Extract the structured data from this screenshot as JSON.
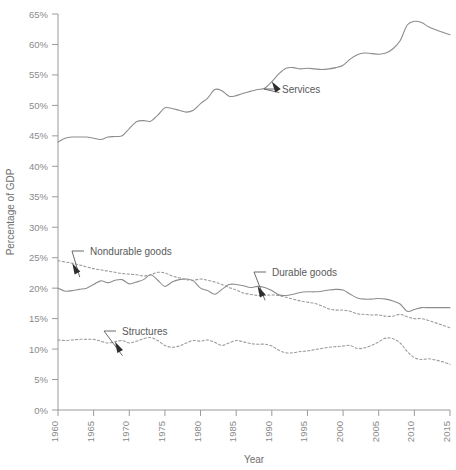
{
  "chart_data": {
    "type": "line",
    "title": "",
    "xlabel": "Year",
    "ylabel": "Percentage of GDP",
    "xlim": [
      1960,
      2015
    ],
    "ylim": [
      0,
      65
    ],
    "grid": false,
    "legend_position": "inline-annotations",
    "xticks": [
      "1960",
      "1965",
      "1970",
      "1975",
      "1980",
      "1985",
      "1990",
      "1995",
      "2000",
      "2005",
      "2010",
      "2015"
    ],
    "yticks": [
      "0%",
      "5%",
      "10%",
      "15%",
      "20%",
      "25%",
      "30%",
      "35%",
      "40%",
      "45%",
      "50%",
      "55%",
      "60%",
      "65%"
    ],
    "x": [
      1960,
      1961,
      1962,
      1963,
      1964,
      1965,
      1966,
      1967,
      1968,
      1969,
      1970,
      1971,
      1972,
      1973,
      1974,
      1975,
      1976,
      1977,
      1978,
      1979,
      1980,
      1981,
      1982,
      1983,
      1984,
      1985,
      1986,
      1987,
      1988,
      1989,
      1990,
      1991,
      1992,
      1993,
      1994,
      1995,
      1996,
      1997,
      1998,
      1999,
      2000,
      2001,
      2002,
      2003,
      2004,
      2005,
      2006,
      2007,
      2008,
      2009,
      2010,
      2011,
      2012,
      2013,
      2014,
      2015
    ],
    "series": [
      {
        "name": "Services",
        "style": "solid",
        "color": "#8d8d8d",
        "annotation": "Services",
        "annotation_year": 1990,
        "values": [
          44.0,
          44.6,
          44.8,
          44.8,
          44.8,
          44.6,
          44.4,
          44.8,
          44.9,
          45.0,
          46.2,
          47.3,
          47.5,
          47.4,
          48.4,
          49.6,
          49.5,
          49.2,
          48.9,
          49.2,
          50.3,
          51.2,
          52.6,
          52.4,
          51.5,
          51.6,
          52.0,
          52.3,
          52.6,
          52.8,
          53.9,
          55.2,
          56.1,
          56.2,
          56.0,
          56.1,
          56.0,
          55.9,
          56.0,
          56.2,
          56.6,
          57.6,
          58.3,
          58.6,
          58.5,
          58.4,
          58.6,
          59.3,
          60.6,
          63.2,
          63.8,
          63.6,
          62.9,
          62.4,
          62.0,
          61.6
        ]
      },
      {
        "name": "Nondurable goods",
        "style": "dashed",
        "color": "#9c9c9c",
        "annotation": "Nondurable goods",
        "annotation_year": 1962,
        "values": [
          24.5,
          24.3,
          24.1,
          23.8,
          23.5,
          23.2,
          23.0,
          22.8,
          22.6,
          22.4,
          22.3,
          22.2,
          22.0,
          22.2,
          22.6,
          22.5,
          22.0,
          21.7,
          21.4,
          21.3,
          21.5,
          21.3,
          21.0,
          20.6,
          20.1,
          19.7,
          19.2,
          19.0,
          18.8,
          18.8,
          18.9,
          18.8,
          18.5,
          18.2,
          17.9,
          17.7,
          17.5,
          17.1,
          16.6,
          16.4,
          16.4,
          16.2,
          15.8,
          15.7,
          15.6,
          15.6,
          15.4,
          15.4,
          15.7,
          15.3,
          15.0,
          15.0,
          14.7,
          14.3,
          13.9,
          13.5
        ]
      },
      {
        "name": "Durable goods",
        "style": "solid",
        "color": "#8d8d8d",
        "annotation": "Durable goods",
        "annotation_year": 1988,
        "values": [
          20.0,
          19.5,
          19.6,
          19.8,
          20.0,
          20.6,
          21.2,
          20.9,
          21.3,
          21.4,
          20.7,
          21.0,
          21.4,
          22.2,
          21.3,
          20.3,
          21.0,
          21.4,
          21.5,
          21.2,
          20.0,
          19.6,
          19.0,
          19.8,
          20.6,
          20.6,
          20.4,
          20.1,
          20.3,
          20.1,
          19.6,
          18.9,
          18.8,
          19.0,
          19.3,
          19.4,
          19.4,
          19.5,
          19.7,
          19.8,
          19.7,
          19.0,
          18.4,
          18.2,
          18.2,
          18.3,
          18.2,
          17.9,
          17.4,
          16.2,
          16.5,
          16.8,
          16.8,
          16.8,
          16.8,
          16.8
        ]
      },
      {
        "name": "Structures",
        "style": "dashed",
        "color": "#9c9c9c",
        "annotation": "Structures",
        "annotation_year": 1968,
        "values": [
          11.5,
          11.4,
          11.5,
          11.6,
          11.6,
          11.6,
          11.3,
          11.0,
          11.2,
          11.4,
          11.0,
          11.3,
          11.7,
          11.9,
          11.4,
          10.6,
          10.3,
          10.5,
          11.0,
          11.4,
          11.3,
          11.5,
          11.1,
          10.6,
          11.0,
          11.4,
          11.2,
          10.9,
          10.8,
          10.8,
          10.5,
          9.8,
          9.4,
          9.4,
          9.6,
          9.7,
          9.9,
          10.1,
          10.3,
          10.4,
          10.5,
          10.6,
          10.1,
          10.2,
          10.6,
          11.2,
          11.8,
          11.7,
          11.0,
          9.6,
          8.6,
          8.3,
          8.4,
          8.2,
          7.9,
          7.5
        ]
      }
    ]
  }
}
